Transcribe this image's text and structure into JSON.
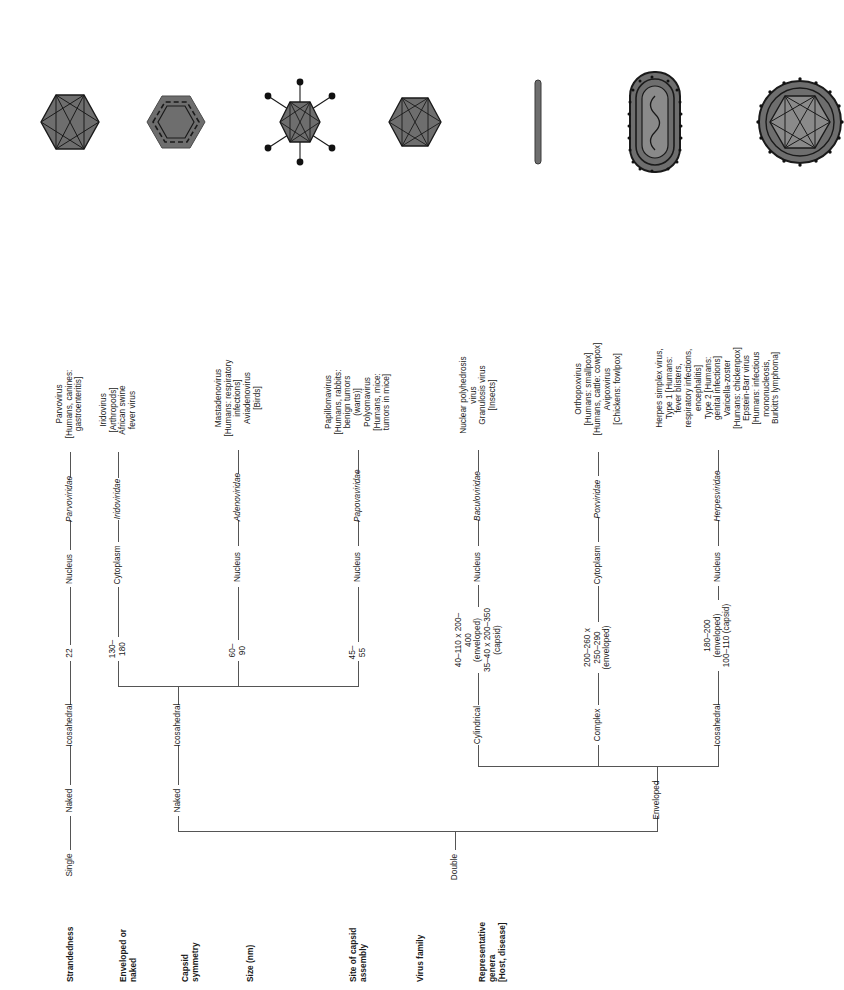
{
  "figure": {
    "orientation": "rotated-90",
    "line_color": "#555555",
    "shape_fill": "#6e6e6e",
    "shape_stroke": "#1a1a1a"
  },
  "row_headers": [
    {
      "id": "strandedness",
      "label": "Strandedness"
    },
    {
      "id": "enveloped-or-naked",
      "label": "Enveloped or\nnaked"
    },
    {
      "id": "capsid-symmetry",
      "label": "Capsid\nsymmetry"
    },
    {
      "id": "size",
      "label": "Size (nm)"
    },
    {
      "id": "site-of-capsid-assembly",
      "label": "Site of capsid\nassembly"
    },
    {
      "id": "virus-family",
      "label": "Virus family"
    },
    {
      "id": "representative-genera",
      "label": "Representative\ngenera\n[Host, disease]"
    }
  ],
  "roots": [
    {
      "id": "single",
      "label": "Single"
    },
    {
      "id": "double",
      "label": "Double"
    }
  ],
  "columns": [
    {
      "id": "parvoviridae",
      "strandedness": "Single",
      "envelope": "Naked",
      "symmetry": "Icosahedral",
      "size": "22",
      "assembly": "Nucleus",
      "family": "Parvoviridae",
      "genera": "Parvovirus\n[Humans, canines:\ngastroenteritis]",
      "shape": "icosahedron"
    },
    {
      "id": "iridoviridae",
      "strandedness": "Double",
      "envelope": "Naked",
      "symmetry": "Icosahedral",
      "size": "130–180",
      "assembly": "Cytoplasm",
      "family": "Iridoviridae",
      "genera": "Iridovirus\n[Arthropods]\nAfrican swine\nfever virus",
      "shape": "hexagon-layered"
    },
    {
      "id": "adenoviridae",
      "strandedness": "Double",
      "envelope": "Naked",
      "symmetry": "Icosahedral",
      "size": "60–90",
      "assembly": "Nucleus",
      "family": "Adenoviridae",
      "genera": "Mastadenovirus\n[Humans: respiratory\ninfections]\nAviadenovirus\n[Birds]",
      "shape": "icosahedron-fibers"
    },
    {
      "id": "papovaviridae",
      "strandedness": "Double",
      "envelope": "Naked",
      "symmetry": "Icosahedral",
      "size": "45–55",
      "assembly": "Nucleus",
      "family": "Papovaviridae",
      "genera": "Papillomavirus\n[Humans, rabbits:\nbenign tumors\n(warts)]\nPolyomavirus\n[Humans, mice:\ntumors in mice]",
      "shape": "icosahedron"
    },
    {
      "id": "baculoviridae",
      "strandedness": "Double",
      "envelope": "Enveloped",
      "symmetry": "Cylindrical",
      "size": "40–110 x 200–400\n(enveloped)\n35–40 x 200–350\n(capsid)",
      "assembly": "Nucleus",
      "family": "Baculoviridae",
      "genera": "Nuclear polyhedrosis\nvirus\nGranulosis virus\n[Insects]",
      "shape": "rod"
    },
    {
      "id": "poxviridae",
      "strandedness": "Double",
      "envelope": "Enveloped",
      "symmetry": "Complex",
      "size": "200–260 x\n250–290\n(enveloped)",
      "assembly": "Cytoplasm",
      "family": "Poxviridae",
      "genera": "Orthopoxvirus\n[Humans: smallpox]\n[Humans, cattle: cowpox]\nAvipoxvirus\n[Chickens: fowlpox]",
      "shape": "brick"
    },
    {
      "id": "herpesviridae",
      "strandedness": "Double",
      "envelope": "Enveloped",
      "symmetry": "Icosahedral",
      "size": "180–200 (enveloped)\n100–110 (capsid)",
      "assembly": "Nucleus",
      "family": "Herpesviridae",
      "genera": "Herpes simplex virus,\nType 1 [Humans:\nfever blisters,\nrespiratory infections,\nencephalitis]\nType 2 [Humans:\ngenital infections]\nVaricella-zoster\n[Humans: chickenpox]\nEpstein-Barr virus\n[Humans: infectious\nmononucleosis,\nBurkitt's lymphoma]",
      "shape": "enveloped-icosahedron"
    }
  ],
  "branch_labels": {
    "naked": "Naked",
    "enveloped": "Enveloped",
    "icosahedral": "Icosahedral",
    "cylindrical": "Cylindrical",
    "complex": "Complex"
  }
}
